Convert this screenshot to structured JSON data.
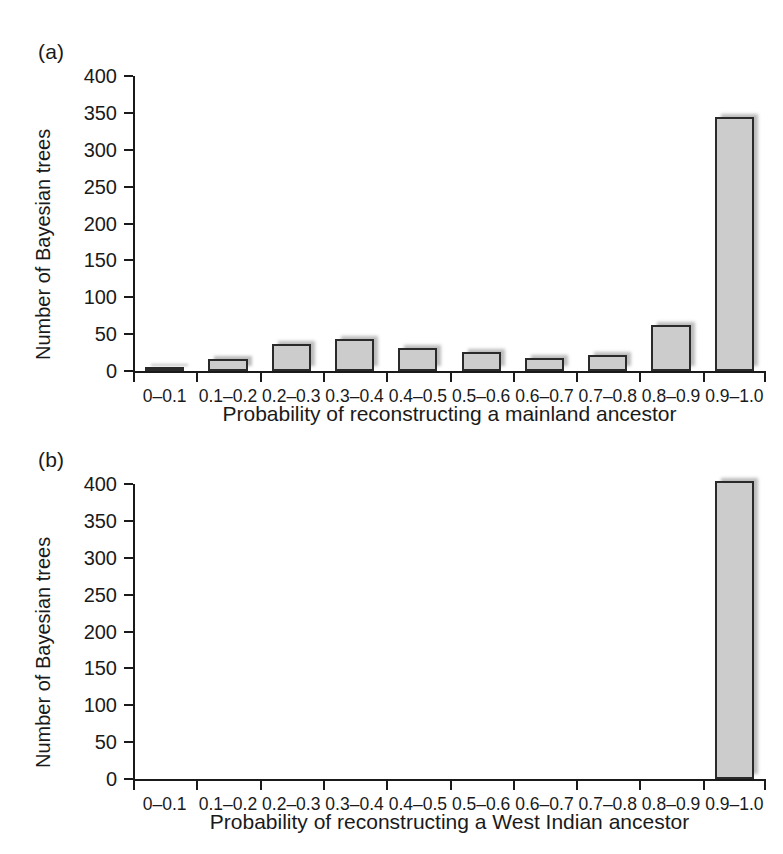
{
  "figure": {
    "panel_a_label": "(a)",
    "panel_b_label": "(b)",
    "bar_color": "#cccccc",
    "bar_edge_color": "#2a2a2a"
  },
  "chart_data": [
    {
      "type": "bar",
      "panel": "(a)",
      "title": "",
      "xlabel": "Probability of reconstructing a mainland ancestor",
      "ylabel": "Number of Bayesian trees",
      "categories": [
        "0–0.1",
        "0.1–0.2",
        "0.2–0.3",
        "0.3–0.4",
        "0.4–0.5",
        "0.5–0.6",
        "0.6–0.7",
        "0.7–0.8",
        "0.8–0.9",
        "0.9–1.0"
      ],
      "values": [
        5,
        16,
        37,
        43,
        31,
        26,
        18,
        22,
        62,
        345
      ],
      "ylim": [
        0,
        400
      ],
      "yticks": [
        0,
        50,
        100,
        150,
        200,
        250,
        300,
        350,
        400
      ],
      "ytick_labels": [
        "0",
        "50",
        "100",
        "150",
        "200",
        "250",
        "300",
        "350",
        "400"
      ],
      "grid": false,
      "legend": "none"
    },
    {
      "type": "bar",
      "panel": "(b)",
      "title": "",
      "xlabel": "Probability of reconstructing a West Indian ancestor",
      "ylabel": "Number of Bayesian trees",
      "categories": [
        "0–0.1",
        "0.1–0.2",
        "0.2–0.3",
        "0.3–0.4",
        "0.4–0.5",
        "0.5–0.6",
        "0.6–0.7",
        "0.7–0.8",
        "0.8–0.9",
        "0.9–1.0"
      ],
      "values": [
        0,
        0,
        0,
        0,
        0,
        0,
        0,
        0,
        0,
        404
      ],
      "ylim": [
        0,
        400
      ],
      "yticks": [
        0,
        50,
        100,
        150,
        200,
        250,
        300,
        350,
        400
      ],
      "ytick_labels": [
        "0",
        "50",
        "100",
        "150",
        "200",
        "250",
        "300",
        "350",
        "400"
      ],
      "grid": false,
      "legend": "none"
    }
  ]
}
